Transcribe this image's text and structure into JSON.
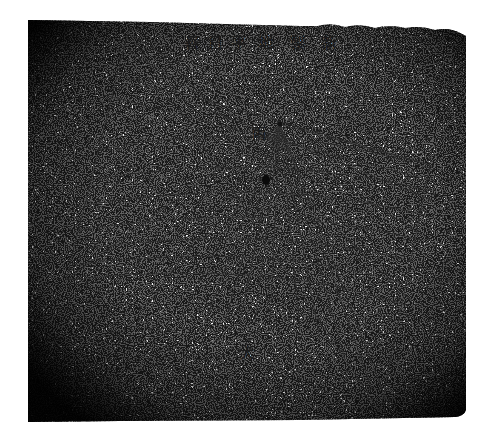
{
  "image": {
    "subject": "stone horizontal sundial rubbing/photograph",
    "title_inscription": {
      "text": "新製地平日晷",
      "reading_direction": "right-to-left",
      "chars": [
        "新",
        "製",
        "地",
        "平",
        "日",
        "晷"
      ]
    },
    "marks": [
      {
        "text": "丙",
        "x": 252,
        "y": 138
      },
      {
        "text": "大",
        "x": 247,
        "y": 355
      }
    ],
    "colors": {
      "background": "#ffffff",
      "stone_light": "#f4f4f4",
      "stone_dark": "#0d0d0d",
      "engraving": "#2a2a2a"
    },
    "gnomon_apex": {
      "x": 280,
      "y": 124
    },
    "stone_outline": {
      "left": 28,
      "top": 20,
      "right": 466,
      "bottom": 422
    }
  }
}
